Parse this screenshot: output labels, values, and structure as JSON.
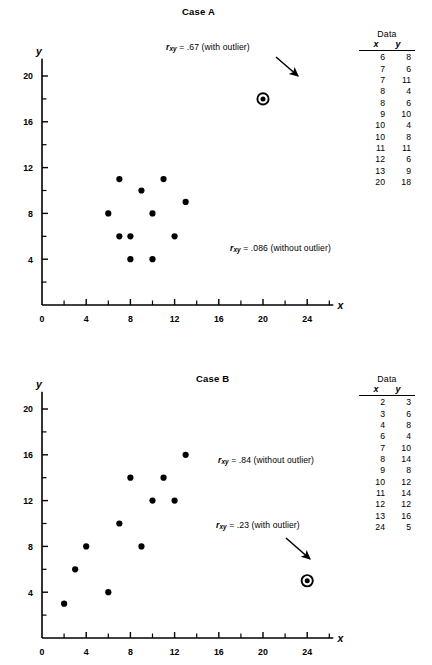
{
  "figure": {
    "panels": [
      {
        "id": "case-a",
        "title": "Case A",
        "axis": {
          "x_label": "x",
          "y_label": "y",
          "x_ticks": [
            "0",
            "4",
            "8",
            "12",
            "16",
            "20",
            "24"
          ],
          "y_ticks": [
            "4",
            "8",
            "12",
            "16",
            "20"
          ],
          "x_minor": [
            2,
            6,
            10,
            14,
            18,
            22,
            26
          ],
          "y_minor": [
            2,
            6,
            10,
            14,
            18
          ],
          "xlim": [
            0,
            26
          ],
          "ylim": [
            0,
            21.5
          ]
        },
        "annotations": [
          {
            "name": "r-with-outlier",
            "prefix": "r",
            "subscript": "xy",
            "text": " = .67 (with outlier)",
            "arrow": true
          },
          {
            "name": "r-without-outlier",
            "prefix": "r",
            "subscript": "xy",
            "text": " = .086 (without outlier)",
            "arrow": false
          }
        ],
        "table": {
          "caption": "Data",
          "col_x": "x",
          "col_y": "y",
          "rows": [
            [
              6,
              8
            ],
            [
              7,
              6
            ],
            [
              7,
              11
            ],
            [
              8,
              4
            ],
            [
              8,
              6
            ],
            [
              9,
              10
            ],
            [
              10,
              4
            ],
            [
              10,
              8
            ],
            [
              11,
              11
            ],
            [
              12,
              6
            ],
            [
              13,
              9
            ],
            [
              20,
              18
            ]
          ]
        },
        "outlier": [
          20,
          18
        ]
      },
      {
        "id": "case-b",
        "title": "Case B",
        "axis": {
          "x_label": "x",
          "y_label": "y",
          "x_ticks": [
            "0",
            "4",
            "8",
            "12",
            "16",
            "20",
            "24"
          ],
          "y_ticks": [
            "4",
            "8",
            "12",
            "16",
            "20"
          ],
          "x_minor": [
            2,
            6,
            10,
            14,
            18,
            22,
            26
          ],
          "y_minor": [
            2,
            6,
            10,
            14,
            18
          ],
          "xlim": [
            0,
            26
          ],
          "ylim": [
            0,
            21.5
          ]
        },
        "annotations": [
          {
            "name": "r-without-outlier",
            "prefix": "r",
            "subscript": "xy",
            "text": " = .84 (without outlier)",
            "arrow": false
          },
          {
            "name": "r-with-outlier",
            "prefix": "r",
            "subscript": "xy",
            "text": " = .23 (with outlier)",
            "arrow": true
          }
        ],
        "table": {
          "caption": "Data",
          "col_x": "x",
          "col_y": "y",
          "rows": [
            [
              2,
              3
            ],
            [
              3,
              6
            ],
            [
              4,
              8
            ],
            [
              6,
              4
            ],
            [
              7,
              10
            ],
            [
              8,
              14
            ],
            [
              9,
              8
            ],
            [
              10,
              12
            ],
            [
              11,
              14
            ],
            [
              12,
              12
            ],
            [
              13,
              16
            ],
            [
              24,
              5
            ]
          ]
        },
        "outlier": [
          24,
          5
        ]
      }
    ]
  },
  "chart_data": [
    {
      "type": "scatter",
      "title": "Case A",
      "xlabel": "x",
      "ylabel": "y",
      "xlim": [
        0,
        26
      ],
      "ylim": [
        0,
        21.5
      ],
      "xticks": [
        0,
        4,
        8,
        12,
        16,
        20,
        24
      ],
      "yticks": [
        4,
        8,
        12,
        16,
        20
      ],
      "grid": false,
      "legend": "none",
      "x": [
        6,
        7,
        7,
        8,
        8,
        9,
        10,
        10,
        11,
        12,
        13,
        20
      ],
      "y": [
        8,
        6,
        11,
        4,
        6,
        10,
        4,
        8,
        11,
        6,
        9,
        18
      ],
      "outlier_index": 11,
      "annotations": [
        "r_xy = .67 (with outlier)",
        "r_xy = .086 (without outlier)"
      ],
      "r_with_outlier": 0.67,
      "r_without_outlier": 0.086
    },
    {
      "type": "scatter",
      "title": "Case B",
      "xlabel": "x",
      "ylabel": "y",
      "xlim": [
        0,
        26
      ],
      "ylim": [
        0,
        21.5
      ],
      "xticks": [
        0,
        4,
        8,
        12,
        16,
        20,
        24
      ],
      "yticks": [
        4,
        8,
        12,
        16,
        20
      ],
      "grid": false,
      "legend": "none",
      "x": [
        2,
        3,
        4,
        6,
        7,
        8,
        9,
        10,
        11,
        12,
        13,
        24
      ],
      "y": [
        3,
        6,
        8,
        4,
        10,
        14,
        8,
        12,
        14,
        12,
        16,
        5
      ],
      "outlier_index": 11,
      "annotations": [
        "r_xy = .84 (without outlier)",
        "r_xy = .23 (with outlier)"
      ],
      "r_with_outlier": 0.23,
      "r_without_outlier": 0.84
    }
  ]
}
